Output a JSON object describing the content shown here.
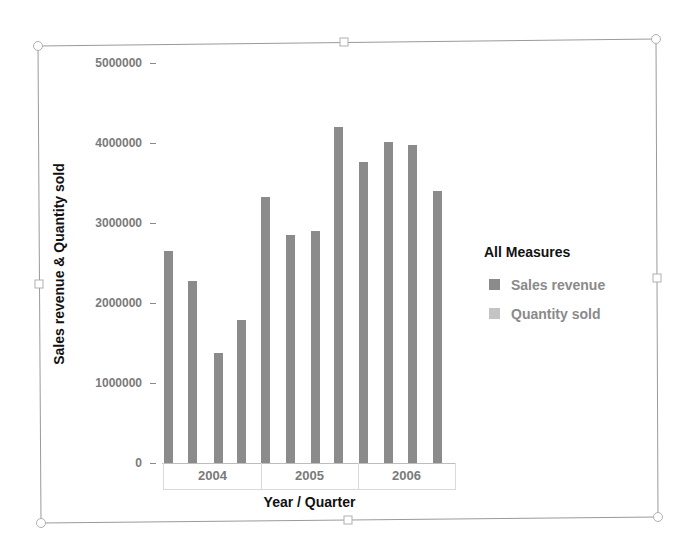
{
  "chart_data": {
    "type": "bar",
    "title": "",
    "xlabel": "Year / Quarter",
    "ylabel": "Sales revenue & Quantity sold",
    "ylim": [
      0,
      5000000
    ],
    "yticks": [
      0,
      1000000,
      2000000,
      3000000,
      4000000,
      5000000
    ],
    "ytick_labels": [
      "0",
      "1000000",
      "2000000",
      "3000000",
      "4000000",
      "5000000"
    ],
    "x_groups": [
      "2004",
      "2005",
      "2006"
    ],
    "categories": [
      "2004 Q1",
      "2004 Q2",
      "2004 Q3",
      "2004 Q4",
      "2005 Q1",
      "2005 Q2",
      "2005 Q3",
      "2005 Q4",
      "2006 Q1",
      "2006 Q2",
      "2006 Q3",
      "2006 Q4"
    ],
    "series": [
      {
        "name": "Sales revenue",
        "color": "#8b8b8b",
        "values": [
          2650000,
          2280000,
          1380000,
          1790000,
          3330000,
          2850000,
          2900000,
          4200000,
          3760000,
          4010000,
          3980000,
          3400000
        ]
      },
      {
        "name": "Quantity sold",
        "color": "#c4c4c4",
        "values": [
          0,
          0,
          0,
          0,
          0,
          0,
          0,
          0,
          0,
          0,
          0,
          0
        ]
      }
    ],
    "legend": {
      "title": "All Measures",
      "position": "right",
      "entries": [
        "Sales revenue",
        "Quantity sold"
      ]
    },
    "grid": false
  },
  "axis": {
    "y_labels": [
      "5000000",
      "4000000",
      "3000000",
      "2000000",
      "1000000",
      "0"
    ],
    "x_groups": [
      "2004",
      "2005",
      "2006"
    ],
    "x_title": "Year / Quarter",
    "y_title": "Sales revenue & Quantity sold"
  },
  "legend": {
    "title": "All Measures",
    "items": [
      {
        "label": "Sales revenue",
        "color": "#8b8b8b"
      },
      {
        "label": "Quantity sold",
        "color": "#c4c4c4"
      }
    ]
  },
  "colors": {
    "bar": "#8b8b8b",
    "frame": "#9a9a9a",
    "handle": "#b0b0b0"
  }
}
